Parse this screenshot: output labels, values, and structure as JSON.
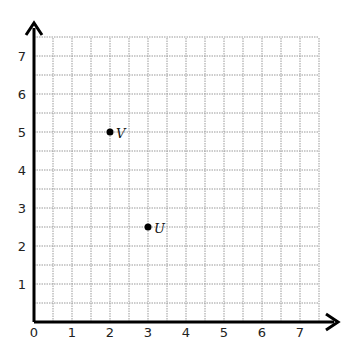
{
  "diagram": {
    "type": "coordinate-plane",
    "grid": {
      "min": 0,
      "max": 7.5,
      "step": 0.5,
      "line_style": "dotted",
      "line_color": "#9a9a9a"
    },
    "x_axis": {
      "ticks": [
        "0",
        "1",
        "2",
        "3",
        "4",
        "5",
        "6",
        "7"
      ]
    },
    "y_axis": {
      "ticks": [
        "1",
        "2",
        "3",
        "4",
        "5",
        "6",
        "7"
      ]
    },
    "points": [
      {
        "label": "V",
        "x": 2,
        "y": 5
      },
      {
        "label": "U",
        "x": 3,
        "y": 2.5
      }
    ]
  }
}
